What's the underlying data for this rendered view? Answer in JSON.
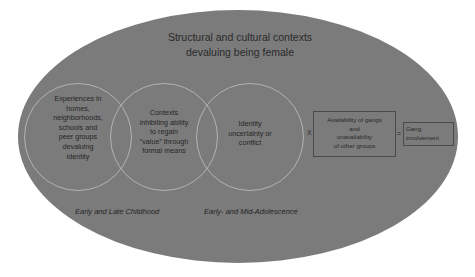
{
  "diagram": {
    "title": {
      "line1": "Structural and cultural contexts",
      "line2": "devaluing being female"
    },
    "circles": [
      {
        "lines": [
          "Experiences in",
          "homes,",
          "neighborhoods,",
          "schools and",
          "peer groups",
          "devaluing",
          "identity"
        ]
      },
      {
        "lines": [
          "Contexts",
          "inhibiting ability",
          "to regain",
          "“value” through",
          "formal means"
        ]
      },
      {
        "lines": [
          "Identity",
          "uncertainty or",
          "conflict"
        ]
      }
    ],
    "operators": {
      "multiply": "X",
      "equals": "="
    },
    "availability_box": {
      "lines": [
        "Availability of gangs",
        "and",
        "unavailability",
        "of other groups"
      ]
    },
    "outcome_box": {
      "lines": [
        "Gang",
        "involvement"
      ]
    },
    "stage_labels": {
      "childhood": "Early and Late Childhood",
      "adolescence": "Early- and Mid-Adolescence"
    },
    "colors": {
      "background": "#ffffff",
      "ellipse_fill": "#7b7b7b",
      "circle_stroke": "#b4b4b4",
      "box_stroke": "#4a4a4a",
      "text": "#2a2a2a"
    }
  }
}
